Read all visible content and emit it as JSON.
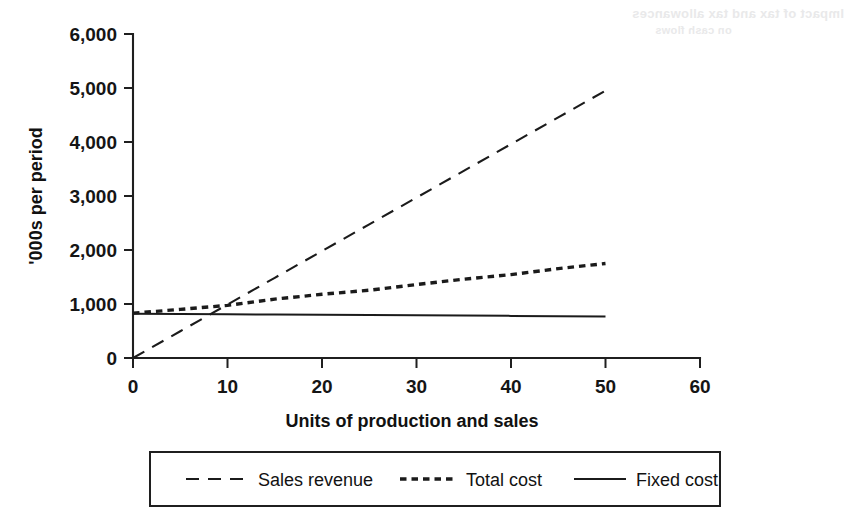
{
  "chart_data": {
    "type": "line",
    "title": "",
    "xlabel": "Units of production and sales",
    "ylabel": "'000s per period",
    "xlim": [
      0,
      60
    ],
    "ylim": [
      0,
      6000
    ],
    "xticks": [
      "0",
      "10",
      "20",
      "30",
      "40",
      "50",
      "60"
    ],
    "xtick_values": [
      0,
      10,
      20,
      30,
      40,
      50,
      60
    ],
    "yticks": [
      "0",
      "1,000",
      "2,000",
      "3,000",
      "4,000",
      "5,000",
      "6,000"
    ],
    "ytick_values": [
      0,
      1000,
      2000,
      3000,
      4000,
      5000,
      6000
    ],
    "grid": false,
    "legend_position": "bottom",
    "x": [
      0,
      5,
      10,
      15,
      20,
      25,
      30,
      35,
      40,
      45,
      50
    ],
    "series": [
      {
        "name": "Sales revenue",
        "style": "dashed",
        "color": "#1b1b1b",
        "values": [
          0,
          495,
          990,
          1485,
          1980,
          2475,
          2970,
          3465,
          3960,
          4455,
          4950
        ]
      },
      {
        "name": "Total cost",
        "style": "dotted",
        "color": "#1b1b1b",
        "values": [
          830,
          900,
          975,
          1090,
          1180,
          1255,
          1360,
          1460,
          1545,
          1655,
          1750
        ]
      },
      {
        "name": "Fixed cost",
        "style": "solid",
        "color": "#1b1b1b",
        "values": [
          820,
          815,
          810,
          805,
          800,
          795,
          790,
          785,
          780,
          775,
          770
        ]
      }
    ],
    "annotations": {
      "break_even_units": 8.5,
      "break_even_value": 840
    }
  },
  "legend": {
    "entries": [
      {
        "label": "Sales revenue",
        "style": "dashed"
      },
      {
        "label": "Total cost",
        "style": "dotted"
      },
      {
        "label": "Fixed cost",
        "style": "solid"
      }
    ]
  },
  "page_artifacts": {
    "bleed_line_1": "Impact of tax and tax allowances",
    "bleed_line_2": "on cash flows"
  }
}
